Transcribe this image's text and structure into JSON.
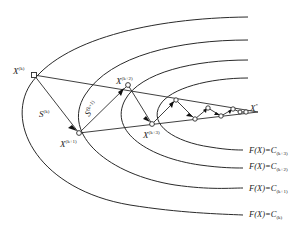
{
  "diagram": {
    "title": "",
    "colors": {
      "stroke": "#2a2a2a",
      "background": "#ffffff",
      "node_fill": "#ffffff"
    },
    "points": {
      "xk": {
        "base": "X",
        "sup": "(k)"
      },
      "xk1": {
        "base": "X",
        "sup": "(k+1)"
      },
      "xk2": {
        "base": "X",
        "sup": "(k+2)"
      },
      "xk3": {
        "base": "X",
        "sup": "(k+3)"
      },
      "xstar": {
        "base": "X",
        "sup": "*"
      }
    },
    "directions": {
      "sk": {
        "base": "S",
        "sup": "(k)"
      },
      "sk1": {
        "base": "S",
        "sup": "(k+1)"
      }
    },
    "contours": [
      {
        "lhs": "F(X)=C",
        "sub": "(k+3)"
      },
      {
        "lhs": "F(X)=C",
        "sub": "(k+2)"
      },
      {
        "lhs": "F(X)=C",
        "sub": "(k+1)"
      },
      {
        "lhs": "F(X)=C",
        "sub": "(k)"
      }
    ]
  }
}
